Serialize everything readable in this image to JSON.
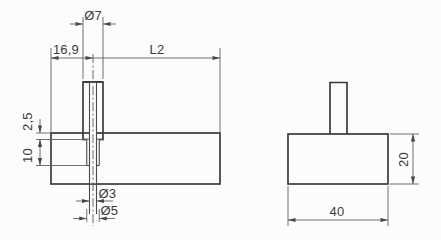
{
  "drawing": {
    "front_view": {
      "labels": {
        "pin_diameter": "Ø7",
        "pin_offset_from_left": "16,9",
        "length_to_right_edge": "L2",
        "recess_depth": "2,5",
        "counterbore_depth": "10",
        "through_hole_diameter": "Ø3",
        "counterbore_diameter": "Ø5"
      }
    },
    "side_view": {
      "labels": {
        "block_height": "20",
        "block_width": "40"
      }
    },
    "colors": {
      "background": "#fcfcfc",
      "outline_line": "#3b3b3b",
      "thin_line": "#616161",
      "hatch_line": "#9e9e9e",
      "text": "#3a3a3a"
    }
  }
}
